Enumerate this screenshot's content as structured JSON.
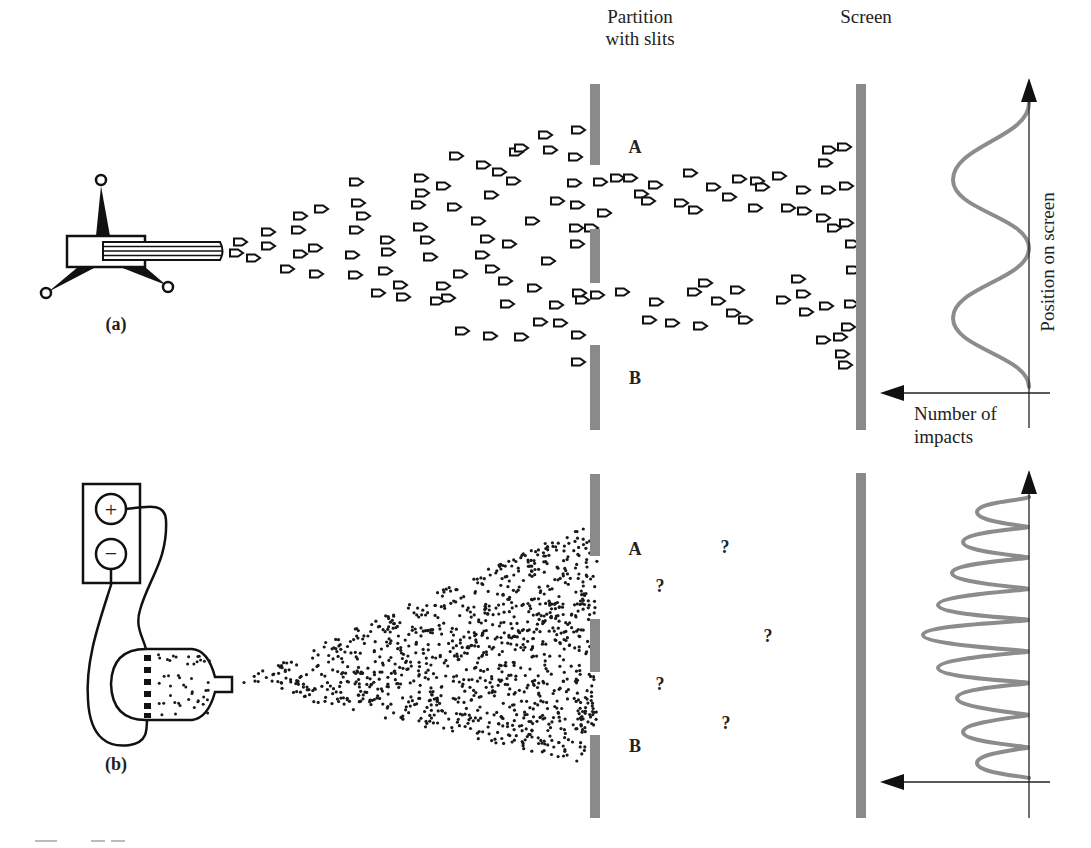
{
  "labels": {
    "partition": [
      "Partition",
      "with slits"
    ],
    "screen": "Screen",
    "panel_a": "(a)",
    "panel_b": "(b)",
    "slit_a": "A",
    "slit_b": "B",
    "y_axis": "Position on screen",
    "x_axis": [
      "Number of",
      "impacts"
    ],
    "battery_plus": "+",
    "battery_minus": "−",
    "unknown_mark": "?"
  },
  "colors": {
    "ink": "#111111",
    "barrier_gray": "#8a8a8a",
    "curve_gray": "#8c8c8c",
    "background": "#ffffff"
  },
  "geometry": {
    "partition_a": [
      [
        595,
        84,
        165
      ],
      [
        595,
        229,
        283
      ],
      [
        595,
        345,
        430
      ]
    ],
    "screen_a": [
      861,
      84,
      430
    ],
    "partition_b": [
      [
        595,
        474,
        556
      ],
      [
        595,
        619,
        672
      ],
      [
        595,
        735,
        818
      ]
    ],
    "screen_b": [
      861,
      473,
      818
    ],
    "axis_a": {
      "x": 1029,
      "top": 78,
      "bottom": 428,
      "h_y": 393,
      "h_left": 880,
      "h_right": 1050
    },
    "axis_b": {
      "x": 1029,
      "top": 470,
      "bottom": 818,
      "h_y": 782,
      "h_left": 880,
      "h_right": 1050
    },
    "cone_b": {
      "apex": [
        233,
        684
      ],
      "top": [
        597,
        520
      ],
      "bottom": [
        597,
        766
      ],
      "dot_count": 1100
    }
  },
  "question_marks": [
    [
      725,
      547
    ],
    [
      660,
      586
    ],
    [
      768,
      636
    ],
    [
      660,
      684
    ],
    [
      726,
      723
    ]
  ],
  "bullets_a": [
    [
      240,
      242
    ],
    [
      236,
      253
    ],
    [
      253,
      258
    ],
    [
      268,
      232
    ],
    [
      268,
      246
    ],
    [
      300,
      216
    ],
    [
      298,
      230
    ],
    [
      300,
      254
    ],
    [
      287,
      269
    ],
    [
      315,
      248
    ],
    [
      321,
      209
    ],
    [
      316,
      274
    ],
    [
      356,
      182
    ],
    [
      358,
      203
    ],
    [
      356,
      230
    ],
    [
      363,
      216
    ],
    [
      352,
      255
    ],
    [
      355,
      275
    ],
    [
      387,
      240
    ],
    [
      388,
      252
    ],
    [
      385,
      271
    ],
    [
      400,
      285
    ],
    [
      378,
      293
    ],
    [
      421,
      178
    ],
    [
      422,
      193
    ],
    [
      418,
      205
    ],
    [
      420,
      227
    ],
    [
      427,
      240
    ],
    [
      430,
      257
    ],
    [
      443,
      186
    ],
    [
      456,
      156
    ],
    [
      454,
      207
    ],
    [
      460,
      274
    ],
    [
      443,
      286
    ],
    [
      448,
      298
    ],
    [
      462,
      331
    ],
    [
      437,
      301
    ],
    [
      403,
      297
    ],
    [
      491,
      195
    ],
    [
      499,
      172
    ],
    [
      483,
      165
    ],
    [
      478,
      221
    ],
    [
      487,
      239
    ],
    [
      482,
      255
    ],
    [
      492,
      269
    ],
    [
      505,
      281
    ],
    [
      507,
      304
    ],
    [
      516,
      152
    ],
    [
      521,
      148
    ],
    [
      509,
      244
    ],
    [
      490,
      336
    ],
    [
      513,
      181
    ],
    [
      521,
      337
    ],
    [
      532,
      221
    ],
    [
      534,
      288
    ],
    [
      545,
      135
    ],
    [
      540,
      322
    ],
    [
      550,
      150
    ],
    [
      548,
      261
    ],
    [
      556,
      305
    ],
    [
      557,
      201
    ],
    [
      576,
      228
    ],
    [
      560,
      323
    ],
    [
      578,
      130
    ],
    [
      575,
      157
    ],
    [
      574,
      183
    ],
    [
      577,
      205
    ],
    [
      577,
      244
    ],
    [
      579,
      293
    ],
    [
      582,
      300
    ],
    [
      578,
      335
    ],
    [
      578,
      362
    ],
    [
      591,
      228
    ],
    [
      597,
      295
    ],
    [
      600,
      182
    ],
    [
      604,
      213
    ],
    [
      617,
      178
    ],
    [
      622,
      292
    ],
    [
      630,
      178
    ],
    [
      641,
      194
    ],
    [
      648,
      201
    ],
    [
      649,
      320
    ],
    [
      655,
      185
    ],
    [
      656,
      302
    ],
    [
      672,
      323
    ],
    [
      681,
      203
    ],
    [
      690,
      173
    ],
    [
      695,
      210
    ],
    [
      700,
      326
    ],
    [
      694,
      292
    ],
    [
      705,
      283
    ],
    [
      713,
      187
    ],
    [
      718,
      301
    ],
    [
      729,
      197
    ],
    [
      733,
      313
    ],
    [
      737,
      290
    ],
    [
      739,
      179
    ],
    [
      745,
      320
    ],
    [
      755,
      208
    ],
    [
      757,
      181
    ],
    [
      762,
      187
    ],
    [
      779,
      176
    ],
    [
      783,
      300
    ],
    [
      788,
      208
    ],
    [
      798,
      279
    ],
    [
      803,
      190
    ],
    [
      803,
      294
    ],
    [
      804,
      211
    ],
    [
      806,
      312
    ],
    [
      823,
      218
    ],
    [
      823,
      340
    ],
    [
      825,
      163
    ],
    [
      828,
      190
    ],
    [
      829,
      150
    ],
    [
      826,
      306
    ],
    [
      834,
      228
    ],
    [
      840,
      337
    ],
    [
      844,
      147
    ],
    [
      846,
      186
    ],
    [
      846,
      223
    ],
    [
      845,
      365
    ],
    [
      852,
      244
    ],
    [
      853,
      270
    ],
    [
      851,
      304
    ],
    [
      848,
      327
    ],
    [
      842,
      354
    ]
  ],
  "curve_a": {
    "axis_x": 1029,
    "points": [
      [
        1029,
        103
      ],
      [
        953,
        180
      ],
      [
        1029,
        248
      ],
      [
        953,
        318
      ],
      [
        1029,
        387
      ]
    ]
  },
  "curve_b": {
    "axis_x": 1029,
    "peaks": [
      [
        977,
        512
      ],
      [
        963,
        542
      ],
      [
        952,
        573
      ],
      [
        938,
        605
      ],
      [
        923,
        635
      ],
      [
        938,
        668
      ],
      [
        957,
        698
      ],
      [
        963,
        732
      ],
      [
        977,
        763
      ]
    ],
    "start_y": 497,
    "end_y": 778
  }
}
